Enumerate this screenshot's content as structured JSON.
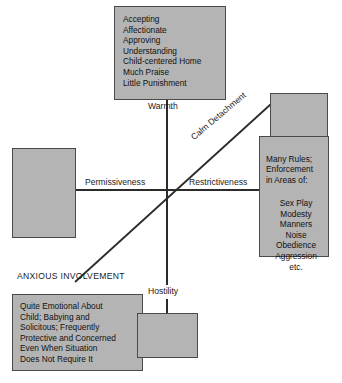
{
  "diagram": {
    "type": "two-axis quadrant model",
    "center": {
      "x": 167,
      "y": 190
    },
    "axes": {
      "vertical": {
        "top_label": "Warmth",
        "bottom_label": "Hostility"
      },
      "horizontal": {
        "left_label": "Permissiveness",
        "right_label": "Restrictiveness"
      },
      "diagonal": {
        "upper_right_label": "Calm Detachment",
        "lower_left_label": "ANXIOUS INVOLVEMENT"
      }
    },
    "boxes": [
      {
        "id": "warmth-traits",
        "position": "top",
        "blank": false,
        "text": "Accepting\nAffectionate\nApproving\nUnderstanding\nChild-centered Home\nMuch Praise\nLittle Punishment"
      },
      {
        "id": "permissiveness-blank",
        "position": "left",
        "blank": true,
        "text": ""
      },
      {
        "id": "calm-detachment-blank",
        "position": "top-right",
        "blank": true,
        "text": ""
      },
      {
        "id": "restrictiveness-traits",
        "position": "right",
        "blank": false,
        "heading": "Many Rules;\nEnforcement\nin Areas of:",
        "areas": "Sex Play\nModesty\nManners\nNoise\nObedience\nAggression\netc."
      },
      {
        "id": "anxious-involvement-traits",
        "position": "bottom-left",
        "blank": false,
        "text": "Quite Emotional About\nChild; Babying and\nSolicitous; Frequently\nProtective and Concerned\nEven When Situation\nDoes Not Require It"
      },
      {
        "id": "hostility-blank",
        "position": "bottom",
        "blank": true,
        "text": ""
      }
    ],
    "colors": {
      "box_fill": "#b4b4b4",
      "box_border": "#4a4a4a",
      "axis": "#2b2b2b",
      "text": "#111111",
      "background": "#ffffff"
    }
  }
}
